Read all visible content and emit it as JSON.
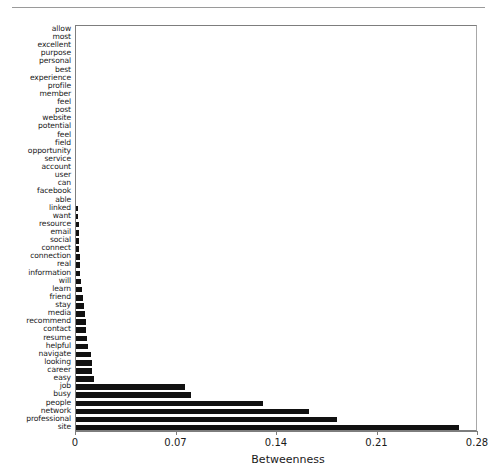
{
  "chart_data": {
    "type": "bar",
    "orientation": "horizontal",
    "title": "",
    "xlabel": "Betweenness",
    "ylabel": "",
    "xlim": [
      0,
      0.28
    ],
    "xticks": [
      0,
      0.07,
      0.14,
      0.21,
      0.28
    ],
    "xticklabels": [
      "0",
      "0.07",
      "0.14",
      "0.21",
      "0.28"
    ],
    "grid": false,
    "legend": null,
    "bar_color": "#111111",
    "frame_color": "#7d7d7d",
    "categories": [
      "allow",
      "most",
      "excellent",
      "purpose",
      "personal",
      "best",
      "experience",
      "profile",
      "member",
      "feel",
      "post",
      "website",
      "potential",
      "feel",
      "field",
      "opportunity",
      "service",
      "account",
      "user",
      "can",
      "facebook",
      "able",
      "linked",
      "want",
      "resource",
      "email",
      "social",
      "connect",
      "connection",
      "real",
      "information",
      "will",
      "learn",
      "friend",
      "stay",
      "media",
      "recommend",
      "contact",
      "resume",
      "helpful",
      "navigate",
      "looking",
      "career",
      "easy",
      "job",
      "busy",
      "people",
      "network",
      "professional",
      "site"
    ],
    "values": [
      0.0,
      0.0,
      0.0,
      0.0,
      0.0,
      0.0,
      0.0,
      0.0,
      0.0,
      0.0,
      0.0,
      0.0,
      0.0,
      0.0,
      0.0,
      0.0,
      0.0,
      0.0,
      0.0,
      0.0,
      0.0,
      0.0,
      0.0016,
      0.0017,
      0.0018,
      0.0021,
      0.0022,
      0.0023,
      0.0025,
      0.0026,
      0.0029,
      0.0036,
      0.0039,
      0.0048,
      0.0057,
      0.0063,
      0.0069,
      0.007,
      0.0074,
      0.0083,
      0.0105,
      0.0108,
      0.0113,
      0.0128,
      0.076,
      0.08,
      0.13,
      0.162,
      0.182,
      0.267
    ]
  },
  "axis": {
    "x_title": "Betweenness"
  }
}
